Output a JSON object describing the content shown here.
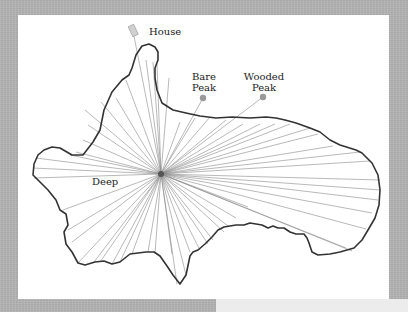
{
  "diagram": {
    "labels": {
      "house": "House",
      "bare_peak_line1": "Bare",
      "bare_peak_line2": "Peak",
      "wooded_peak_line1": "Wooded",
      "wooded_peak_line2": "Peak",
      "deep": "Deep"
    },
    "colors": {
      "background": "#b3b3b3",
      "panel": "#ffffff",
      "outline": "#333333",
      "rays": "#8a8a8a",
      "markers": "#999999",
      "house": "#d0d0d0"
    }
  }
}
